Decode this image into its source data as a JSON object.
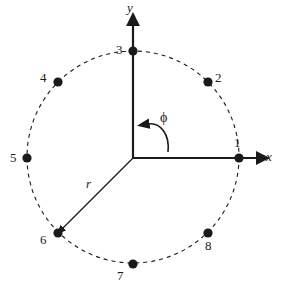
{
  "figure": {
    "title": "",
    "background_color": "#ffffff",
    "ink_color": "#1a1a1a",
    "width": 282,
    "height": 291
  },
  "geometry": {
    "center": {
      "x": 133,
      "y": 157
    },
    "origin": {
      "x": 133,
      "y": 158
    },
    "radius": 106
  },
  "axes": {
    "x": {
      "label": "x",
      "label_pos": {
        "x": 268,
        "y": 152
      },
      "from": {
        "x": 133,
        "y": 158
      },
      "to": {
        "x": 262,
        "y": 158
      }
    },
    "y": {
      "label": "y",
      "label_pos": {
        "x": 127,
        "y": 2
      },
      "from": {
        "x": 133,
        "y": 158
      },
      "to": {
        "x": 133,
        "y": 18
      }
    }
  },
  "radius_vector": {
    "label": "r",
    "label_pos": {
      "x": 86,
      "y": 178
    },
    "from": {
      "x": 133,
      "y": 158
    },
    "to": {
      "x": 58,
      "y": 233
    },
    "angle_deg": 225
  },
  "angle_arc": {
    "label": "ϕ",
    "label_pos": {
      "x": 160,
      "y": 112
    },
    "direction": "counterclockwise",
    "arrow_tip": {
      "x": 141,
      "y": 125
    }
  },
  "circle": {
    "style": "dashed",
    "dash_pattern": "4 4"
  },
  "points": [
    {
      "id": "1",
      "angle_deg": 0,
      "dot": {
        "x": 239,
        "y": 158
      },
      "label": "1",
      "label_pos": {
        "x": 235,
        "y": 141
      }
    },
    {
      "id": "2",
      "angle_deg": 45,
      "dot": {
        "x": 208,
        "y": 82
      },
      "label": "2",
      "label_pos": {
        "x": 215,
        "y": 72
      }
    },
    {
      "id": "3",
      "angle_deg": 90,
      "dot": {
        "x": 133,
        "y": 51
      },
      "label": "3",
      "label_pos": {
        "x": 117,
        "y": 43
      }
    },
    {
      "id": "4",
      "angle_deg": 135,
      "dot": {
        "x": 58,
        "y": 82
      },
      "label": "4",
      "label_pos": {
        "x": 41,
        "y": 72
      }
    },
    {
      "id": "5",
      "angle_deg": 180,
      "dot": {
        "x": 27,
        "y": 158
      },
      "label": "5",
      "label_pos": {
        "x": 11,
        "y": 151
      }
    },
    {
      "id": "6",
      "angle_deg": 225,
      "dot": {
        "x": 58,
        "y": 233
      },
      "label": "6",
      "label_pos": {
        "x": 41,
        "y": 234
      }
    },
    {
      "id": "7",
      "angle_deg": 270,
      "dot": {
        "x": 133,
        "y": 264
      },
      "label": "7",
      "label_pos": {
        "x": 118,
        "y": 270
      }
    },
    {
      "id": "8",
      "angle_deg": 315,
      "dot": {
        "x": 208,
        "y": 233
      },
      "label": "8",
      "label_pos": {
        "x": 206,
        "y": 240
      }
    }
  ]
}
